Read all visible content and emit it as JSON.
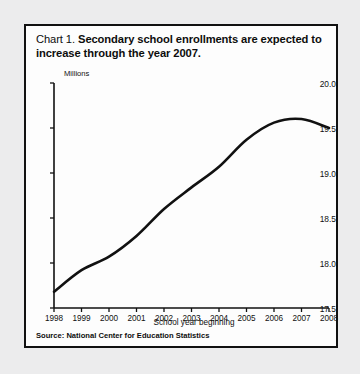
{
  "figure": {
    "label": "Chart 1.",
    "title": "Secondary school enrollments are expected to increase through the year 2007.",
    "source": "Source: National Center for Education Statistics",
    "frame_color": "#111111",
    "background": "#fdfdfd",
    "page_background": "#ececed",
    "line_color": "#111111"
  },
  "chart_data": {
    "type": "line",
    "title": "Chart 1. Secondary school enrollments are expected to increase through the year 2007.",
    "xlabel": "School year beginning",
    "ylabel": "Millions",
    "units": "Millions",
    "grid": false,
    "legend": "none",
    "xlim": [
      1998,
      2008
    ],
    "ylim": [
      17.5,
      20.0
    ],
    "ytick_step": 0.5,
    "xticks": [
      1998,
      1999,
      2000,
      2001,
      2002,
      2003,
      2004,
      2005,
      2006,
      2007,
      2008
    ],
    "xtick_labels": [
      "1998",
      "1999",
      "2000",
      "2001",
      "2002",
      "2003",
      "2004",
      "2005",
      "2006",
      "2007",
      "2008"
    ],
    "yticks": [
      17.5,
      18.0,
      18.5,
      19.0,
      19.5,
      20.0
    ],
    "ytick_labels": [
      "17.5",
      "18.0",
      "18.5",
      "19.0",
      "19.5",
      "20.0"
    ],
    "x": [
      1998,
      1999,
      2000,
      2001,
      2002,
      2003,
      2004,
      2005,
      2006,
      2007,
      2008
    ],
    "values": [
      17.68,
      17.92,
      18.07,
      18.3,
      18.6,
      18.84,
      19.07,
      19.37,
      19.56,
      19.6,
      19.5
    ],
    "series": [
      {
        "name": "Secondary school enrollments",
        "values": [
          17.68,
          17.92,
          18.07,
          18.3,
          18.6,
          18.84,
          19.07,
          19.37,
          19.56,
          19.6,
          19.5
        ]
      }
    ],
    "annotations": []
  }
}
